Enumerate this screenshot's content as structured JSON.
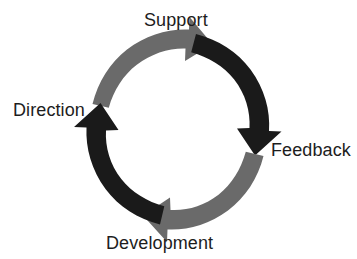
{
  "diagram": {
    "type": "cycle",
    "title": "",
    "background_color": "#ffffff",
    "direction": "clockwise",
    "stage_count": 4,
    "stages": [
      {
        "id": "support",
        "label": "Support",
        "position": "top"
      },
      {
        "id": "feedback",
        "label": "Feedback",
        "position": "right"
      },
      {
        "id": "development",
        "label": "Development",
        "position": "bottom"
      },
      {
        "id": "direction",
        "label": "Direction",
        "position": "left"
      }
    ],
    "arrows": [
      {
        "id": "direction-to-support",
        "name": "arrow-direction-to-support",
        "from": "direction",
        "to": "support",
        "color": "#6a6a6a",
        "tone": "gray",
        "quadrant": "upper-left",
        "head_points": "right"
      },
      {
        "id": "support-to-feedback",
        "name": "arrow-support-to-feedback",
        "from": "support",
        "to": "feedback",
        "color": "#1a1a1a",
        "tone": "black",
        "quadrant": "upper-right",
        "head_points": "down"
      },
      {
        "id": "feedback-to-development",
        "name": "arrow-feedback-to-development",
        "from": "feedback",
        "to": "development",
        "color": "#6a6a6a",
        "tone": "gray",
        "quadrant": "lower-right",
        "head_points": "left"
      },
      {
        "id": "development-to-direction",
        "name": "arrow-development-to-direction",
        "from": "development",
        "to": "direction",
        "color": "#1a1a1a",
        "tone": "black",
        "quadrant": "lower-left",
        "head_points": "up"
      }
    ],
    "label_color": "#1d1d1d"
  }
}
